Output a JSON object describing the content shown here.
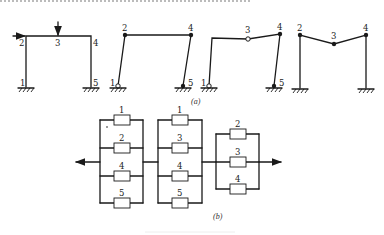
{
  "figure": {
    "caption_a": "(a)",
    "caption_b": "(b)",
    "colors": {
      "line": "#1a1a1a",
      "background": "#ffffff"
    }
  },
  "frames": [
    {
      "id": "frame-original",
      "nodes": [
        {
          "label": "1",
          "x": 26,
          "y": 87
        },
        {
          "label": "2",
          "x": 26,
          "y": 36
        },
        {
          "label": "3",
          "x": 58,
          "y": 36
        },
        {
          "label": "4",
          "x": 91,
          "y": 36
        },
        {
          "label": "5",
          "x": 91,
          "y": 87
        }
      ],
      "loads": [
        {
          "type": "vertical",
          "x": 58,
          "y1": 22,
          "y2": 36
        },
        {
          "type": "horizontal",
          "x1": 13,
          "x2": 26,
          "y": 36
        }
      ]
    },
    {
      "id": "frame-sway-mechanism",
      "nodes": [
        {
          "label": "1",
          "x": 118,
          "y": 86
        },
        {
          "label": "2",
          "x": 125,
          "y": 35
        },
        {
          "label": "4",
          "x": 191,
          "y": 35
        },
        {
          "label": "5",
          "x": 183,
          "y": 86
        }
      ]
    },
    {
      "id": "frame-combined-mechanism",
      "nodes": [
        {
          "label": "1",
          "x": 209,
          "y": 86
        },
        {
          "label": "",
          "x": 212,
          "y": 38
        },
        {
          "label": "3",
          "x": 248,
          "y": 39
        },
        {
          "label": "4",
          "x": 280,
          "y": 34
        },
        {
          "label": "5",
          "x": 274,
          "y": 86
        }
      ]
    },
    {
      "id": "frame-beam-mechanism",
      "nodes": [
        {
          "label": "",
          "x": 300,
          "y": 88
        },
        {
          "label": "2",
          "x": 300,
          "y": 35
        },
        {
          "label": "3",
          "x": 334,
          "y": 44
        },
        {
          "label": "4",
          "x": 366,
          "y": 35
        },
        {
          "label": "",
          "x": 366,
          "y": 88
        }
      ]
    }
  ],
  "reliability_blocks": [
    {
      "id": "group-1",
      "elements": [
        "1",
        "2",
        "4",
        "5"
      ]
    },
    {
      "id": "group-2",
      "elements": [
        "1",
        "3",
        "4",
        "5"
      ]
    },
    {
      "id": "group-3",
      "elements": [
        "2",
        "3",
        "4"
      ]
    }
  ]
}
